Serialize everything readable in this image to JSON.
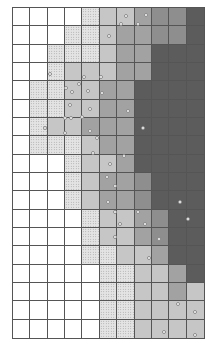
{
  "diagram": {
    "type": "zoned-grid-map",
    "columns": 11,
    "rows": 18,
    "legend_levels": [
      {
        "level": 0,
        "fill": "#ffffff",
        "pattern": "none"
      },
      {
        "level": 1,
        "fill": "#e4e4e4",
        "pattern": "dotted"
      },
      {
        "level": 2,
        "fill": "#c6c6c6",
        "pattern": "none"
      },
      {
        "level": 3,
        "fill": "#a2a2a2",
        "pattern": "none"
      },
      {
        "level": 4,
        "fill": "#8e8e8e",
        "pattern": "none"
      },
      {
        "level": 5,
        "fill": "#5c5c5c",
        "pattern": "none"
      }
    ],
    "cells": [
      [
        0,
        0,
        0,
        0,
        1,
        2,
        2,
        3,
        4,
        4,
        5
      ],
      [
        0,
        0,
        0,
        1,
        1,
        2,
        3,
        3,
        4,
        4,
        5
      ],
      [
        0,
        0,
        1,
        1,
        1,
        2,
        3,
        3,
        5,
        5,
        5
      ],
      [
        0,
        0,
        1,
        2,
        2,
        2,
        3,
        3,
        5,
        5,
        5
      ],
      [
        0,
        1,
        1,
        2,
        2,
        3,
        3,
        5,
        5,
        5,
        5
      ],
      [
        0,
        1,
        1,
        2,
        2,
        3,
        3,
        5,
        5,
        5,
        5
      ],
      [
        0,
        1,
        2,
        2,
        3,
        3,
        3,
        5,
        5,
        5,
        5
      ],
      [
        0,
        1,
        1,
        1,
        2,
        3,
        3,
        5,
        5,
        5,
        5
      ],
      [
        0,
        0,
        0,
        1,
        2,
        2,
        3,
        5,
        5,
        5,
        5
      ],
      [
        0,
        0,
        0,
        1,
        2,
        3,
        3,
        4,
        5,
        5,
        5
      ],
      [
        0,
        0,
        0,
        1,
        2,
        3,
        3,
        4,
        5,
        5,
        5
      ],
      [
        0,
        0,
        0,
        0,
        1,
        2,
        2,
        3,
        4,
        5,
        5
      ],
      [
        0,
        0,
        0,
        0,
        1,
        2,
        2,
        3,
        4,
        5,
        5
      ],
      [
        0,
        0,
        0,
        0,
        1,
        1,
        2,
        2,
        3,
        5,
        5
      ],
      [
        0,
        0,
        0,
        0,
        0,
        1,
        1,
        2,
        2,
        3,
        5
      ],
      [
        0,
        0,
        0,
        0,
        0,
        1,
        1,
        2,
        2,
        3,
        2
      ],
      [
        0,
        0,
        0,
        0,
        0,
        1,
        1,
        2,
        2,
        2,
        2
      ],
      [
        0,
        0,
        0,
        0,
        0,
        1,
        1,
        2,
        2,
        2,
        2
      ]
    ],
    "markers": [
      [
        126,
        16
      ],
      [
        146,
        15
      ],
      [
        121,
        24
      ],
      [
        138,
        24
      ],
      [
        109,
        36
      ],
      [
        50,
        74
      ],
      [
        84,
        77
      ],
      [
        101,
        77
      ],
      [
        66,
        88
      ],
      [
        79,
        84
      ],
      [
        88,
        91
      ],
      [
        72,
        92
      ],
      [
        102,
        93
      ],
      [
        70,
        105
      ],
      [
        90,
        109
      ],
      [
        128,
        111
      ],
      [
        65,
        118
      ],
      [
        71,
        118
      ],
      [
        82,
        117
      ],
      [
        45,
        128
      ],
      [
        65,
        133
      ],
      [
        90,
        131
      ],
      [
        143,
        128
      ],
      [
        97,
        138
      ],
      [
        93,
        153
      ],
      [
        124,
        156
      ],
      [
        110,
        164
      ],
      [
        107,
        177
      ],
      [
        115,
        186
      ],
      [
        108,
        202
      ],
      [
        180,
        202
      ],
      [
        115,
        212
      ],
      [
        138,
        212
      ],
      [
        120,
        224
      ],
      [
        145,
        224
      ],
      [
        188,
        219
      ],
      [
        115,
        237
      ],
      [
        159,
        239
      ],
      [
        149,
        258
      ],
      [
        178,
        304
      ],
      [
        195,
        312
      ],
      [
        164,
        332
      ],
      [
        195,
        335
      ]
    ]
  }
}
